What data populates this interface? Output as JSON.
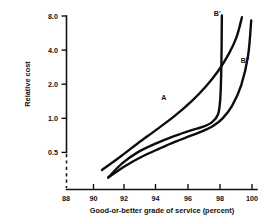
{
  "chart_data": {
    "type": "line",
    "title": "",
    "xlabel": "Good-or-better grade of service  (percent)",
    "ylabel": "Relative cost",
    "xlim": [
      88,
      100.6
    ],
    "ylim": [
      0.28,
      8.6
    ],
    "yscale": "log",
    "grid": false,
    "legend_position": "inline-curve-labels",
    "xticks": [
      88,
      90,
      92,
      94,
      96,
      98,
      100
    ],
    "xtick_labels": [
      "88",
      "90",
      "92",
      "94",
      "96",
      "98",
      "100"
    ],
    "yticks": [
      0.5,
      1.0,
      2.0,
      4.0,
      8.0
    ],
    "ytick_labels": [
      "0.5",
      "1.0",
      "2.0",
      "4.0",
      "8.0"
    ],
    "axis_break": true,
    "series": [
      {
        "name": "A",
        "label": "A",
        "label_x": 94.3,
        "label_y": 1.45,
        "x": [
          90.3,
          91.5,
          92.6,
          93.8,
          95.0,
          96.1,
          97.0,
          97.8,
          98.5,
          99.0,
          99.35
        ],
        "y": [
          0.35,
          0.46,
          0.6,
          0.79,
          1.05,
          1.42,
          1.9,
          2.6,
          3.7,
          5.2,
          7.8
        ]
      },
      {
        "name": "B'",
        "label": "B'",
        "label_x": 97.75,
        "label_y": 8.05,
        "x": [
          90.7,
          91.6,
          92.6,
          93.8,
          95.0,
          96.0,
          96.8,
          97.4,
          97.8,
          97.95,
          98.02,
          98.05
        ],
        "y": [
          0.3,
          0.4,
          0.5,
          0.6,
          0.7,
          0.78,
          0.84,
          0.92,
          1.08,
          1.5,
          3.0,
          8.1
        ]
      },
      {
        "name": "B''",
        "label": "B''",
        "label_x": 99.55,
        "label_y": 3.05,
        "x": [
          90.7,
          91.8,
          92.9,
          94.0,
          95.0,
          96.0,
          96.8,
          97.5,
          98.1,
          98.7,
          99.3,
          99.75,
          99.95
        ],
        "y": [
          0.3,
          0.38,
          0.46,
          0.54,
          0.62,
          0.7,
          0.77,
          0.86,
          1.0,
          1.28,
          1.95,
          3.6,
          7.3
        ]
      }
    ]
  },
  "axes": {
    "ylabel": "Relative cost",
    "xlabel": "Good-or-better grade of service  (percent)"
  }
}
